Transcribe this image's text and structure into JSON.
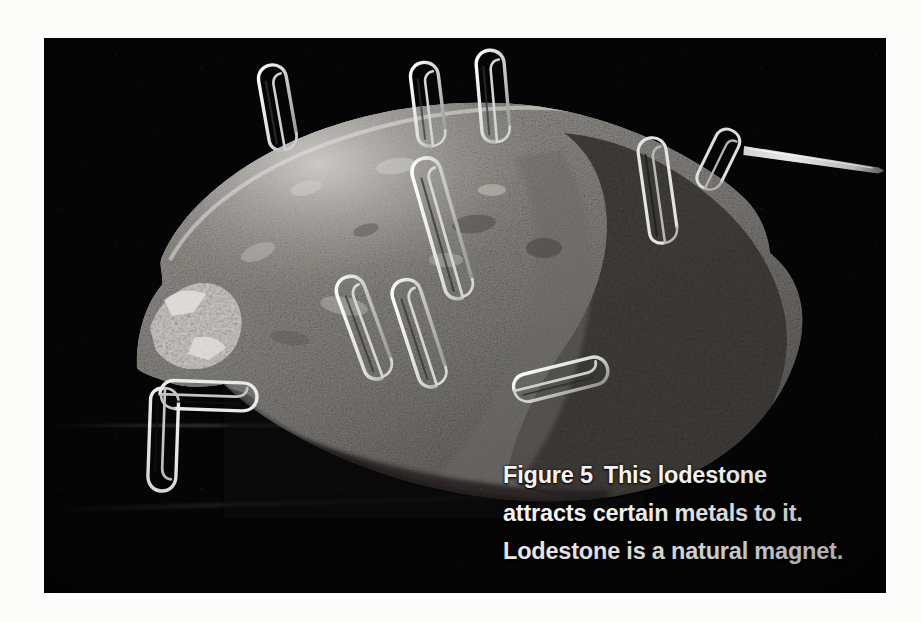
{
  "page": {
    "background_color": "#fcfcfb"
  },
  "figure": {
    "plate": {
      "name": "lodestone-photograph",
      "background_color": "#050505",
      "description": "Black-and-white photograph of a rough grey lodestone rock on a black background with steel paper clips clinging to its surface and a sewing needle projecting from its right edge."
    },
    "subject": {
      "name": "lodestone",
      "color_light": "#b9b7b2",
      "color_mid": "#8d8b87",
      "color_dark": "#3c3b39"
    },
    "objects": [
      {
        "name": "paper-clip",
        "count": 11
      },
      {
        "name": "sewing-needle",
        "count": 1
      }
    ],
    "caption": {
      "figure_label": "Figure 5",
      "lines": [
        "This lodestone",
        "attracts certain metals to it.",
        "Lodestone is a natural magnet."
      ],
      "full_text": "Figure 5  This lodestone attracts certain metals to it. Lodestone is a natural magnet.",
      "text_color": "#f4f4f2"
    }
  }
}
